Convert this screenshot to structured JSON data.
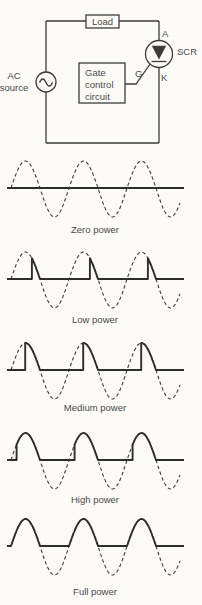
{
  "colors": {
    "background": "#fcfbf8",
    "ink": "#3c3c3c",
    "wave": "#2e2e2e",
    "text": "#4a4a4a"
  },
  "circuit": {
    "load_label": "Load",
    "ac_source_label": [
      "AC",
      "source"
    ],
    "gate_box_label": [
      "Gate",
      "control",
      "circuit"
    ],
    "scr_terminals": {
      "anode": "A",
      "gate": "G",
      "cathode": "K"
    },
    "scr_label": "SCR"
  },
  "waveforms": [
    {
      "label": "Zero power",
      "firing_angle_deg": 180
    },
    {
      "label": "Low power",
      "firing_angle_deg": 130
    },
    {
      "label": "Medium power",
      "firing_angle_deg": 88
    },
    {
      "label": "High power",
      "firing_angle_deg": 35
    },
    {
      "label": "Full power",
      "firing_angle_deg": 0
    }
  ],
  "wave_geometry": {
    "x0": 11,
    "period": 58,
    "amp_up": 27,
    "amp_down": 29,
    "baseline": 32,
    "cycles": 3,
    "x_solid_start": 7,
    "x_solid_end": 184,
    "x_dash_end": 180
  },
  "wave_rows": [
    {
      "svg_top": 156,
      "label_top": 224
    },
    {
      "svg_top": 247,
      "label_top": 314
    },
    {
      "svg_top": 338,
      "label_top": 402
    },
    {
      "svg_top": 428,
      "label_top": 494
    },
    {
      "svg_top": 514,
      "label_top": 586
    }
  ]
}
